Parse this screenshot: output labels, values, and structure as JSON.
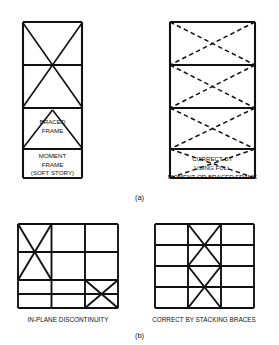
{
  "figure": {
    "domain": "structural-engineering-diagram",
    "panels": [
      {
        "id": "a",
        "label": "(a)",
        "topic": "vertical-irregularity-soft-story",
        "diagrams": [
          {
            "id": "a-left",
            "kind": "elevation-frame",
            "stories": 4,
            "bays": 1,
            "bracing": "X-brace spanning upper two stories, chevron brace in third story, open bottom story",
            "line_style": "solid",
            "captions": [
              "BRACED",
              "FRAME",
              "MOMENT",
              "FRAME",
              "(SOFT STORY)"
            ]
          },
          {
            "id": "a-right",
            "kind": "elevation-frame",
            "stories": 4,
            "bays": 1,
            "bracing": "dashed X-braces in every story (full height)",
            "line_style": "dashed",
            "captions": [
              "CORRECT BY",
              "USING FULL",
              "MOMENT OR BRACED FRAME"
            ]
          }
        ]
      },
      {
        "id": "b",
        "label": "(b)",
        "topic": "in-plane-discontinuity",
        "diagrams": [
          {
            "id": "b-left",
            "kind": "elevation-frame",
            "stories": 4,
            "bays": 3,
            "bracing": "X-brace in upper-left bay (top two stories) and X-brace in lower-right bay (bottom two stories)",
            "line_style": "solid",
            "caption": "IN-PLANE DISCONTINUITY"
          },
          {
            "id": "b-right",
            "kind": "elevation-frame",
            "stories": 4,
            "bays": 3,
            "bracing": "two stacked X-braces in the centre bay, continuous over full height",
            "line_style": "solid",
            "caption": "CORRECT BY STACKING BRACES"
          }
        ]
      }
    ],
    "colors": {
      "line": "#111111",
      "background": "#ffffff",
      "text": "#111111"
    }
  }
}
